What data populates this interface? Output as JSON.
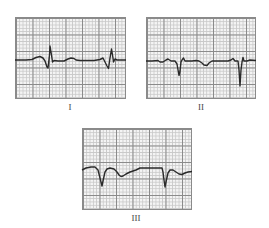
{
  "figure": {
    "panels": [
      {
        "id": "I",
        "label": "I",
        "description": "Lead I tracing: small P wave, biphasic QRS with tall R, T wave; second complex near right edge"
      },
      {
        "id": "II",
        "label": "II",
        "description": "Lead II tracing: negative QRS deflections, shallow inverted T wave; deep negative complex near right edge"
      },
      {
        "id": "III",
        "label": "III",
        "description": "Lead III tracing: deep Q/QS complexes with inverted T waves"
      }
    ],
    "colors": {
      "trace": "#2a2a2a",
      "grid_major": "#8a8a8a",
      "grid_minor": "#c9c9c9",
      "paper": "#f4f4f4",
      "background": "#ffffff"
    }
  }
}
